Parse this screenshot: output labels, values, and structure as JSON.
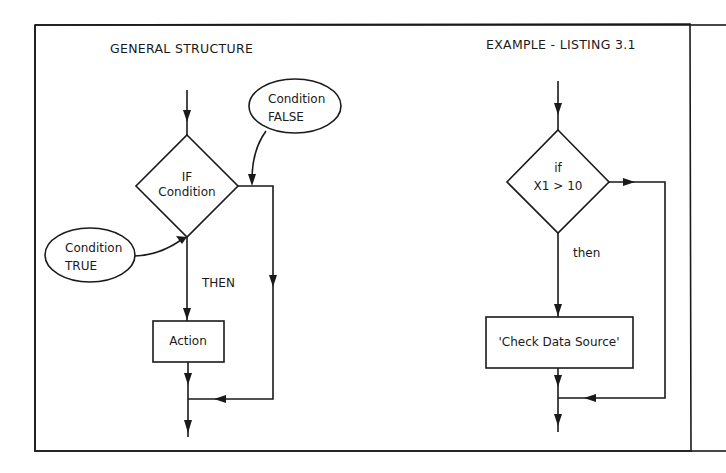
{
  "panels": {
    "general": {
      "title": "GENERAL STRUCTURE",
      "decision_line1": "IF",
      "decision_line2": "Condition",
      "false_label_line1": "Condition",
      "false_label_line2": "FALSE",
      "true_label_line1": "Condition",
      "true_label_line2": "TRUE",
      "then_label": "THEN",
      "action_label": "Action"
    },
    "example": {
      "title": "EXAMPLE - LISTING 3.1",
      "decision_line1": "if",
      "decision_line2": "X1 > 10",
      "then_label": "then",
      "action_label": "'Check Data Source'"
    }
  },
  "colors": {
    "ink": "#1a1a1a",
    "background": "#ffffff"
  }
}
